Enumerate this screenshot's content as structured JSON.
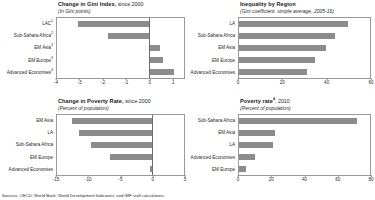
{
  "figure": {
    "footer": "Sources: OECD; World Bank; World Development Indicators; and IMF staff calculations."
  },
  "panels": {
    "gini_change": {
      "title_bold": "Change in Gini Index,",
      "title_norm": " since 2000",
      "subtitle": "(In Gini points)"
    },
    "inequality_region": {
      "title_bold": "Inequality by Region",
      "title_norm": "",
      "subtitle": "(Gini coefficient, simple average, 2005-16)"
    },
    "poverty_change": {
      "title_bold": "Change in Poverty Rate,",
      "title_norm": " since 2000",
      "subtitle": "(Percent of population)"
    },
    "poverty_rate": {
      "title_bold": "Poverty rate",
      "title_sup": "4",
      "title_norm": ", 2010",
      "subtitle": "(Percent of population)"
    }
  },
  "chart_data": [
    {
      "type": "bar",
      "orientation": "horizontal",
      "id": "gini_change",
      "title": "Change in Gini Index, since 2000",
      "subtitle": "(In Gini points)",
      "xlabel": "",
      "ylabel": "",
      "xlim": [
        -4,
        1.5
      ],
      "xticks": [
        -4,
        -3,
        -2,
        -1,
        0,
        1
      ],
      "xticklabels": [
        "-4",
        "-3",
        "-2",
        "-1",
        "0",
        "1"
      ],
      "grid": false,
      "legend": "none",
      "categories": [
        "LAC",
        "Sub-Sahara Africa",
        "EM Asia",
        "EM Europe",
        "Advanced Economies"
      ],
      "category_footnotes": [
        "1",
        "2",
        "3",
        "3",
        "4"
      ],
      "values": [
        -3.1,
        -1.8,
        0.45,
        0.6,
        1.05
      ]
    },
    {
      "type": "bar",
      "orientation": "horizontal",
      "id": "inequality_region",
      "title": "Inequality by Region",
      "subtitle": "(Gini coefficient, simple average, 2005-16)",
      "xlabel": "",
      "ylabel": "",
      "xlim": [
        0,
        60
      ],
      "xticks": [
        0,
        20,
        40,
        60
      ],
      "xticklabels": [
        "0",
        "20",
        "40",
        "60"
      ],
      "grid": false,
      "legend": "none",
      "categories": [
        "LA",
        "Sub-Sahara Africa",
        "EM Asia",
        "EM Europe",
        "Advanced Economies"
      ],
      "values": [
        50,
        44,
        40,
        35,
        31
      ]
    },
    {
      "type": "bar",
      "orientation": "horizontal",
      "id": "poverty_change",
      "title": "Change in Poverty Rate, since 2000",
      "subtitle": "(Percent of population)",
      "xlabel": "",
      "ylabel": "",
      "xlim": [
        -15,
        5
      ],
      "xticks": [
        -15,
        -10,
        -5,
        0,
        5
      ],
      "xticklabels": [
        "-15",
        "-10",
        "-5",
        "0",
        "5"
      ],
      "grid": false,
      "legend": "none",
      "categories": [
        "EM Asia",
        "LA",
        "Sub-Sahara Africa",
        "EM Europe",
        "Advanced Economies"
      ],
      "values": [
        -12.6,
        -11.6,
        -9.7,
        -6.7,
        -0.4
      ]
    },
    {
      "type": "bar",
      "orientation": "horizontal",
      "id": "poverty_rate",
      "title": "Poverty rate4, 2010",
      "subtitle": "(Percent of population)",
      "xlabel": "",
      "ylabel": "",
      "xlim": [
        0,
        80
      ],
      "xticks": [
        0,
        20,
        40,
        60,
        80
      ],
      "xticklabels": [
        "0",
        "20",
        "40",
        "60",
        "80"
      ],
      "grid": false,
      "legend": "none",
      "categories": [
        "Sub-Sahara Africa",
        "EM Asia",
        "LA",
        "Advanced Economies",
        "EM Europe"
      ],
      "values": [
        72,
        22,
        21,
        10,
        4
      ]
    }
  ]
}
